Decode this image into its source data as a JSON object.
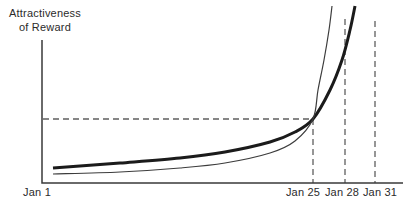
{
  "figure": {
    "background_color": "#ffffff"
  },
  "chart_data": {
    "type": "line",
    "title": "",
    "y_axis_label_lines": [
      "Attractiveness",
      "of Reward"
    ],
    "x_tick_labels": [
      {
        "label": "Jan 1",
        "x_px": 37
      },
      {
        "label": "Jan 25",
        "x_px": 303
      },
      {
        "label": "Jan 28",
        "x_px": 342
      },
      {
        "label": "Jan 31",
        "x_px": 380
      }
    ],
    "canvas_px": {
      "width": 406,
      "height": 210
    },
    "axes": {
      "origin_px": {
        "x": 42,
        "y": 183
      },
      "x_end_px": 403,
      "y_top_px": 40,
      "color": "#3a3a3a",
      "width_px": 1.5
    },
    "series": [
      {
        "name": "larger-later-reward-curve",
        "stroke_color": "#1b1b1b",
        "stroke_width_px": 3,
        "points_px": [
          [
            53,
            168
          ],
          [
            120,
            163
          ],
          [
            180,
            158
          ],
          [
            225,
            152
          ],
          [
            270,
            142
          ],
          [
            295,
            132
          ],
          [
            313,
            119
          ],
          [
            330,
            90
          ],
          [
            342,
            60
          ],
          [
            350,
            30
          ],
          [
            355,
            6
          ]
        ]
      },
      {
        "name": "smaller-sooner-reward-curve",
        "stroke_color": "#3c3c3c",
        "stroke_width_px": 1.2,
        "points_px": [
          [
            53,
            174
          ],
          [
            120,
            172
          ],
          [
            180,
            168
          ],
          [
            225,
            163
          ],
          [
            270,
            153
          ],
          [
            295,
            141
          ],
          [
            313,
            119
          ],
          [
            318,
            90
          ],
          [
            324,
            60
          ],
          [
            329,
            30
          ],
          [
            332,
            6
          ]
        ]
      }
    ],
    "preference_crossing_point_px": {
      "x": 313,
      "y": 119
    },
    "dashed_guides": {
      "color": "#5f5f5f",
      "width_px": 1.3,
      "dash_pattern": "6 4",
      "horizontal": {
        "y_px": 119,
        "x1_px": 43,
        "x2_px": 313
      },
      "verticals": [
        {
          "at_tick": "Jan 25",
          "x_px": 313,
          "y1_px": 119,
          "y2_px": 183
        },
        {
          "at_tick": "Jan 28",
          "x_px": 345,
          "y1_px": 19,
          "y2_px": 183
        },
        {
          "at_tick": "Jan 31",
          "x_px": 375,
          "y1_px": 21,
          "y2_px": 183
        }
      ]
    },
    "tick_label_color": "#2b2b2b",
    "tick_label_y_px": 186
  }
}
